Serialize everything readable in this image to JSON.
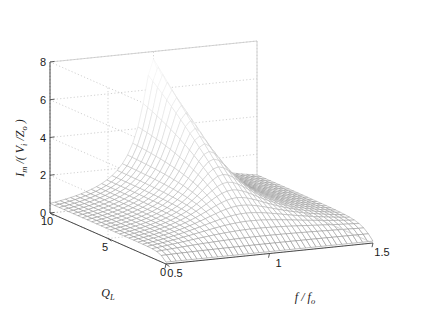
{
  "chart_data": {
    "type": "surface",
    "title": "",
    "xlabel": "f / f_o",
    "ylabel": "Q_L",
    "zlabel": "I_m /( V_i /Z_o )",
    "xlim": [
      0.5,
      1.5
    ],
    "ylim": [
      0,
      10
    ],
    "zlim": [
      0,
      8
    ],
    "xticks": [
      "0.5",
      "1",
      "1.5"
    ],
    "xtick_values": [
      0.5,
      1,
      1.5
    ],
    "yticks": [
      "0",
      "5",
      "10"
    ],
    "ytick_values": [
      0,
      5,
      10
    ],
    "zticks": [
      "0",
      "2",
      "4",
      "6",
      "8"
    ],
    "ztick_values": [
      0,
      2,
      4,
      6,
      8
    ],
    "grid": true,
    "legend": "none",
    "colormap": "gray",
    "mesh": true,
    "view_azimuth": -37.5,
    "view_elevation": 30,
    "x_samples": [
      0.5,
      0.525,
      0.55,
      0.575,
      0.6,
      0.625,
      0.65,
      0.675,
      0.7,
      0.725,
      0.75,
      0.775,
      0.8,
      0.825,
      0.85,
      0.875,
      0.9,
      0.925,
      0.95,
      0.975,
      1.0,
      1.025,
      1.05,
      1.075,
      1.1,
      1.125,
      1.15,
      1.175,
      1.2,
      1.225,
      1.25,
      1.275,
      1.3,
      1.325,
      1.35,
      1.375,
      1.4,
      1.425,
      1.45,
      1.475,
      1.5
    ],
    "y_samples": [
      0,
      0.4,
      0.8,
      1.2,
      1.6,
      2.0,
      2.4,
      2.8,
      3.2,
      3.6,
      4.0,
      4.4,
      4.8,
      5.2,
      5.6,
      6.0,
      6.4,
      6.8,
      7.2,
      7.6,
      8.0,
      8.4,
      8.8,
      9.2,
      9.6,
      10.0
    ],
    "surface_formula": "z(x,y) = (0.75*y + 0.1) / sqrt(1 + (y*(x - 1/x))^2)",
    "peak": {
      "x": 1.0,
      "y": 10.0,
      "z": 7.5
    },
    "z_at_peak_by_QL": [
      {
        "QL": 0,
        "z": 0.1
      },
      {
        "QL": 2,
        "z": 1.6
      },
      {
        "QL": 4,
        "z": 3.1
      },
      {
        "QL": 6,
        "z": 4.6
      },
      {
        "QL": 8,
        "z": 6.1
      },
      {
        "QL": 10,
        "z": 7.6
      }
    ]
  },
  "axes": {
    "z_label_text": "I",
    "z_label_sub": "m",
    "z_label_mid": " /( V",
    "z_label_sub2": "i",
    "z_label_mid2": " /Z",
    "z_label_sub3": "o",
    "z_label_end": " )",
    "y_label_text": "Q",
    "y_label_sub": "L",
    "x_label_text": "f / f",
    "x_label_sub": "o"
  }
}
